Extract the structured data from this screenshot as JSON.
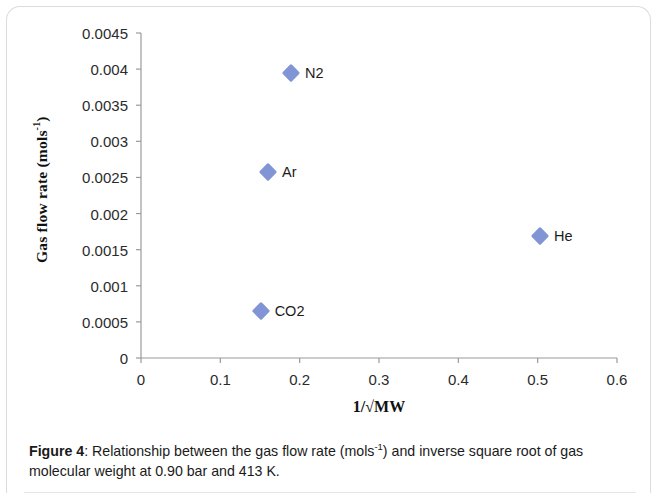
{
  "figure": {
    "caption_prefix": "Figure 4",
    "caption_separator": ":",
    "caption_text_part1": " Relationship between the gas flow rate (mols",
    "caption_superscript": "-1",
    "caption_text_part2": ") and inverse square root of gas molecular weight at 0.90 bar and 413 K."
  },
  "chart_data": {
    "type": "scatter",
    "title": "",
    "xlabel": "1/√MW",
    "ylabel": "Gas flow rate (mols⁻¹)",
    "ylabel_base": "Gas flow rate (mols",
    "ylabel_sup": "-1",
    "ylabel_tail": ")",
    "xlabel_base": "1/√MW",
    "xlim": [
      0,
      0.6
    ],
    "ylim": [
      0,
      0.0045
    ],
    "grid": false,
    "legend": "none",
    "marker_color": "#8094d6",
    "marker_shape": "diamond",
    "axis_color": "#9a9a9a",
    "xticks": [
      "0",
      "0.1",
      "0.2",
      "0.3",
      "0.4",
      "0.5",
      "0.6"
    ],
    "xtick_values": [
      0,
      0.1,
      0.2,
      0.3,
      0.4,
      0.5,
      0.6
    ],
    "yticks": [
      "0",
      "0.0005",
      "0.001",
      "0.0015",
      "0.002",
      "0.0025",
      "0.003",
      "0.0035",
      "0.004",
      "0.0045"
    ],
    "ytick_values": [
      0,
      0.0005,
      0.001,
      0.0015,
      0.002,
      0.0025,
      0.003,
      0.0035,
      0.004,
      0.0045
    ],
    "points": [
      {
        "label": "CO2",
        "x": 0.1508,
        "y": 0.00065
      },
      {
        "label": "Ar",
        "x": 0.1601,
        "y": 0.00258
      },
      {
        "label": "N2",
        "x": 0.189,
        "y": 0.00395
      },
      {
        "label": "He",
        "x": 0.503,
        "y": 0.00169
      }
    ]
  }
}
